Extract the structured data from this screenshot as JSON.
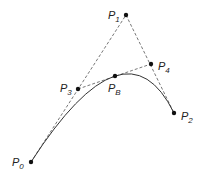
{
  "diagram": {
    "points": [
      {
        "id": "P0",
        "label": "P",
        "sub": "0",
        "x": 31,
        "y": 162,
        "lx": 12,
        "ly": 166
      },
      {
        "id": "P1",
        "label": "P",
        "sub": "1",
        "x": 126,
        "y": 15,
        "lx": 108,
        "ly": 19
      },
      {
        "id": "P2",
        "label": "P",
        "sub": "2",
        "x": 174,
        "y": 113,
        "lx": 181,
        "ly": 120
      },
      {
        "id": "P3",
        "label": "P",
        "sub": "3",
        "x": 78,
        "y": 89,
        "lx": 60,
        "ly": 92
      },
      {
        "id": "P4",
        "label": "P",
        "sub": "4",
        "x": 151,
        "y": 64,
        "lx": 158,
        "ly": 70
      },
      {
        "id": "PB",
        "label": "P",
        "sub": "B",
        "x": 115,
        "y": 76,
        "lx": 108,
        "ly": 92
      }
    ],
    "dashed_lines": [
      [
        "P0",
        "P1"
      ],
      [
        "P1",
        "P2"
      ],
      [
        "P3",
        "P4"
      ]
    ],
    "curve": {
      "type": "quadratic",
      "from": "P0",
      "control": "P1",
      "to": "P2"
    },
    "colors": {
      "line": "#555555",
      "curve": "#333333",
      "point": "#111111"
    }
  }
}
